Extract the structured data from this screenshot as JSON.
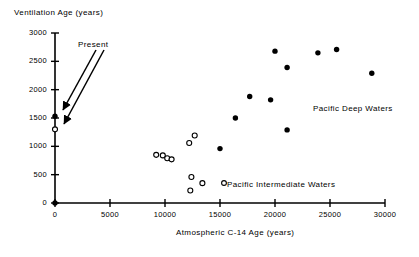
{
  "chart_data": {
    "type": "scatter",
    "title": "",
    "xlabel": "Atmospheric C-14 Age (years)",
    "ylabel": "Ventilation Age (years)",
    "xlim": [
      0,
      30000
    ],
    "ylim": [
      0,
      3000
    ],
    "xticks": [
      0,
      5000,
      10000,
      15000,
      20000,
      25000,
      30000
    ],
    "yticks": [
      0,
      500,
      1000,
      1500,
      2000,
      2500,
      3000
    ],
    "xtick_labels": [
      "0",
      "5000",
      "10000",
      "15000",
      "20000",
      "25000",
      "30000"
    ],
    "ytick_labels": [
      "0",
      "500",
      "1000",
      "1500",
      "2000",
      "2500",
      "3000"
    ],
    "grid": false,
    "legend_position": "inline-annotation",
    "series": [
      {
        "name": "Pacific Deep Waters",
        "marker": "filled-circle",
        "color": "#000000",
        "points": [
          {
            "x": 0,
            "y": 0
          },
          {
            "x": 0,
            "y": 1530
          },
          {
            "x": 15000,
            "y": 960
          },
          {
            "x": 16400,
            "y": 1500
          },
          {
            "x": 17700,
            "y": 1880
          },
          {
            "x": 19600,
            "y": 1820
          },
          {
            "x": 20000,
            "y": 2680
          },
          {
            "x": 21100,
            "y": 2390
          },
          {
            "x": 21100,
            "y": 1290
          },
          {
            "x": 23900,
            "y": 2650
          },
          {
            "x": 25600,
            "y": 2710
          },
          {
            "x": 28800,
            "y": 2290
          }
        ]
      },
      {
        "name": "Pacific Intermediate Waters",
        "marker": "open-circle",
        "color": "#000000",
        "points": [
          {
            "x": 0,
            "y": 1300
          },
          {
            "x": 9200,
            "y": 850
          },
          {
            "x": 9800,
            "y": 840
          },
          {
            "x": 10200,
            "y": 790
          },
          {
            "x": 10600,
            "y": 770
          },
          {
            "x": 12200,
            "y": 1060
          },
          {
            "x": 12700,
            "y": 1190
          },
          {
            "x": 12400,
            "y": 460
          },
          {
            "x": 12300,
            "y": 220
          },
          {
            "x": 13400,
            "y": 350
          }
        ]
      }
    ],
    "annotations": [
      {
        "text": "Present",
        "kind": "arrow-label",
        "points_to": [
          {
            "x": 0,
            "y": 1530
          },
          {
            "x": 0,
            "y": 1300
          }
        ]
      },
      {
        "text": "Pacific Deep Waters",
        "kind": "series-label"
      },
      {
        "text": "Pacific Intermediate Waters",
        "kind": "series-label-with-marker"
      }
    ]
  },
  "axes": {
    "y_title": "Ventilation  Age  (years)",
    "x_title": "Atmospheric  C-14  Age  (years)"
  },
  "labels": {
    "present": "Present",
    "deep_waters": "Pacific  Deep  Waters",
    "intermediate_waters": "Pacific  Intermediate  Waters"
  }
}
